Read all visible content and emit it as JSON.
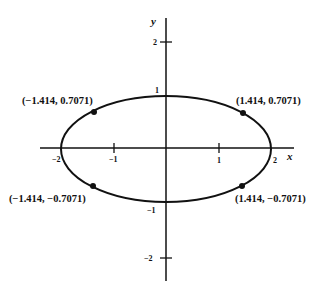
{
  "diagram": {
    "type": "ellipse-plot",
    "equation_shape": "ellipse x^2/4 + y^2 = 1",
    "axes": {
      "x_label": "x",
      "y_label": "y",
      "x_ticks": [
        {
          "value": -2,
          "label": "−2"
        },
        {
          "value": -1,
          "label": "−1"
        },
        {
          "value": 1,
          "label": "1"
        },
        {
          "value": 2,
          "label": "2"
        }
      ],
      "y_ticks": [
        {
          "value": 2,
          "label": "2"
        },
        {
          "value": 1,
          "label": "1"
        },
        {
          "value": -1,
          "label": "−1"
        },
        {
          "value": -2,
          "label": "−2"
        }
      ]
    },
    "points": [
      {
        "x": -1.414,
        "y": 0.7071,
        "label": "(−1.414, 0.7071)"
      },
      {
        "x": 1.414,
        "y": 0.7071,
        "label": "(1.414, 0.7071)"
      },
      {
        "x": -1.414,
        "y": -0.7071,
        "label": "(−1.414, −0.7071)"
      },
      {
        "x": 1.414,
        "y": -0.7071,
        "label": "(1.414, −0.7071)"
      }
    ],
    "colors": {
      "stroke": "#111111",
      "background": "#ffffff"
    }
  }
}
